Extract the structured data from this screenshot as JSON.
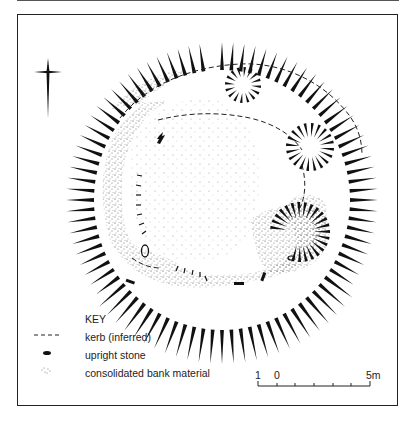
{
  "figure": {
    "type": "archaeological site plan",
    "north_arrow": "north-arrow-icon"
  },
  "key": {
    "title": "KEY",
    "items": [
      {
        "symbol": "dashed-line",
        "label": "kerb (inferred)"
      },
      {
        "symbol": "black-dash",
        "label": "upright stone"
      },
      {
        "symbol": "stipple",
        "label": "consolidated bank material"
      }
    ]
  },
  "scale_bar": {
    "labels": [
      "1",
      "0",
      "5m"
    ],
    "ticks": 7
  },
  "colors": {
    "ink": "#111111",
    "stipple": "#555555",
    "background": "#ffffff"
  }
}
